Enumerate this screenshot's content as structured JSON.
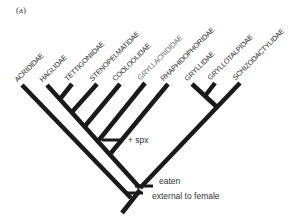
{
  "figure": {
    "panel_label": "(a)",
    "line_color": "#1a1a1a",
    "taxa": [
      {
        "name": "ACRIDIDAE"
      },
      {
        "name": "HAGLIDAE"
      },
      {
        "name": "TETTIGONIIDAE"
      },
      {
        "name": "STENOPELMATIDAE"
      },
      {
        "name": "COOLOOLIDAE"
      },
      {
        "name": "GRYLLACRIDIDAE"
      },
      {
        "name": "RHAPHIDOPHORIDAE"
      },
      {
        "name": "GRYLLIDAE"
      },
      {
        "name": "GRYLLOTALPIDAE"
      },
      {
        "name": "SCHIZODACTYLIDAE"
      }
    ],
    "annotations": {
      "spx": "+ spx",
      "eaten": "eaten",
      "external": "external to female"
    }
  }
}
